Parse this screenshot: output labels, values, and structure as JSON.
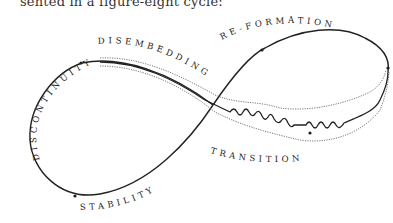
{
  "caption": "sented in a figure-eight cycle:",
  "diagram": {
    "type": "figure-eight cycle",
    "phases": [
      {
        "id": "discontinuity",
        "label": "DISCONTINUITY"
      },
      {
        "id": "disembedding",
        "label": "DISEMBEDDING"
      },
      {
        "id": "re-formation",
        "label": "RE-FORMATION"
      },
      {
        "id": "transition",
        "label": "TRANSITION"
      },
      {
        "id": "stability",
        "label": "STABILITY"
      }
    ],
    "colors": {
      "line": "#222222",
      "dotted": "#555555",
      "background": "#ffffff"
    }
  }
}
